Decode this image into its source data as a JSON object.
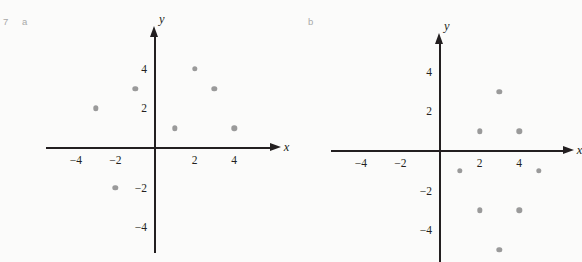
{
  "figure": {
    "question_number": "7",
    "parts": [
      {
        "key": "a",
        "label": "a"
      },
      {
        "key": "b",
        "label": "b"
      }
    ],
    "point_color": "#9a9a9a",
    "axis_color": "#231f20",
    "background_color": "#fbfbfa"
  },
  "chart_data": [
    {
      "id": "a",
      "type": "scatter",
      "title": "",
      "xlabel": "x",
      "ylabel": "y",
      "xlim": [
        -5.5,
        5.8
      ],
      "ylim": [
        -5.3,
        5.6
      ],
      "grid": false,
      "legend": null,
      "xticks": [
        -4,
        -2,
        2,
        4
      ],
      "yticks": [
        4,
        2,
        -2,
        -4
      ],
      "xticklabels": [
        "−4",
        "−2",
        "2",
        "4"
      ],
      "yticklabels": [
        "4",
        "2",
        "−2",
        "−4"
      ],
      "origin_px": {
        "x": 155,
        "y": 148
      },
      "unit_px": 19.8,
      "points": [
        {
          "x": -3,
          "y": 2
        },
        {
          "x": -1,
          "y": 3
        },
        {
          "x": 2,
          "y": 4
        },
        {
          "x": 3,
          "y": 3
        },
        {
          "x": 1,
          "y": 1
        },
        {
          "x": 4,
          "y": 1
        },
        {
          "x": -2,
          "y": -2
        }
      ]
    },
    {
      "id": "b",
      "type": "scatter",
      "title": "",
      "xlabel": "x",
      "ylabel": "y",
      "xlim": [
        -5.5,
        6.2
      ],
      "ylim": [
        -5.6,
        5.4
      ],
      "grid": false,
      "legend": null,
      "xticks": [
        -4,
        -2,
        2,
        4
      ],
      "yticks": [
        4,
        2,
        -2,
        -4
      ],
      "xticklabels": [
        "−4",
        "−2",
        "2",
        "4"
      ],
      "yticklabels": [
        "4",
        "2",
        "−2",
        "−4"
      ],
      "origin_px": {
        "x": 157,
        "y": 151
      },
      "unit_px": 19.8,
      "points": [
        {
          "x": 3,
          "y": 3
        },
        {
          "x": 2,
          "y": 1
        },
        {
          "x": 4,
          "y": 1
        },
        {
          "x": 1,
          "y": -1
        },
        {
          "x": 5,
          "y": -1
        },
        {
          "x": 2,
          "y": -3
        },
        {
          "x": 4,
          "y": -3
        },
        {
          "x": 3,
          "y": -5
        }
      ]
    }
  ]
}
